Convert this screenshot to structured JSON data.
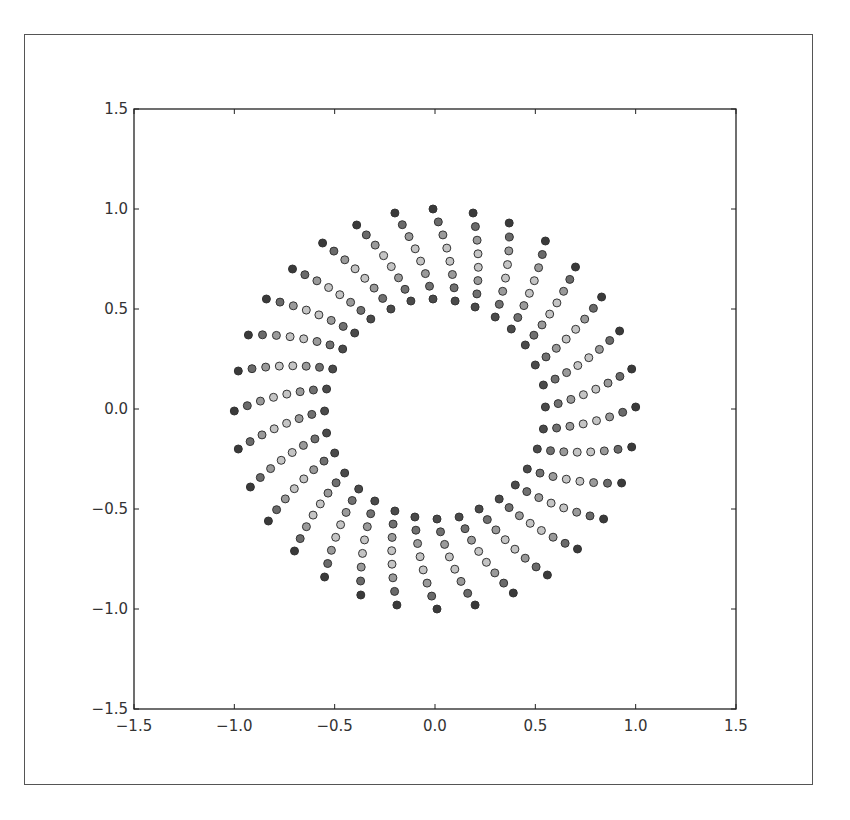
{
  "figure": {
    "frame_color": "#555555",
    "background": "#ffffff"
  },
  "chart_data": {
    "type": "scatter",
    "title": "",
    "xlabel": "",
    "ylabel": "",
    "xlim": [
      -1.5,
      1.5
    ],
    "ylim": [
      -1.5,
      1.5
    ],
    "xticks": [
      "−1.5",
      "−1.0",
      "−0.5",
      "0.0",
      "0.5",
      "1.0",
      "1.5"
    ],
    "yticks": [
      "−1.5",
      "−1.0",
      "−0.5",
      "0.0",
      "0.5",
      "1.0",
      "1.5"
    ],
    "xtick_values": [
      -1.5,
      -1.0,
      -0.5,
      0.0,
      0.5,
      1.0,
      1.5
    ],
    "ytick_values": [
      -1.5,
      -1.0,
      -0.5,
      0.0,
      0.5,
      1.0,
      1.5
    ],
    "grid": false,
    "legend": null,
    "points_per_spoke": 8,
    "marker_size": 8,
    "marker_edge_color": "#333333",
    "point_colors": [
      "#4a4a4a",
      "#707070",
      "#9a9a9a",
      "#c4c4c4",
      "#c4c4c4",
      "#9a9a9a",
      "#6a6a6a",
      "#3a3a3a"
    ],
    "spokes": [
      {
        "inner": [
          0.54,
          -0.1
        ],
        "outer": [
          1.0,
          0.01
        ]
      },
      {
        "inner": [
          0.55,
          0.01
        ],
        "outer": [
          0.98,
          0.2
        ]
      },
      {
        "inner": [
          0.54,
          0.12
        ],
        "outer": [
          0.92,
          0.39
        ]
      },
      {
        "inner": [
          0.5,
          0.22
        ],
        "outer": [
          0.83,
          0.56
        ]
      },
      {
        "inner": [
          0.45,
          0.32
        ],
        "outer": [
          0.7,
          0.71
        ]
      },
      {
        "inner": [
          0.38,
          0.4
        ],
        "outer": [
          0.55,
          0.84
        ]
      },
      {
        "inner": [
          0.3,
          0.46
        ],
        "outer": [
          0.37,
          0.93
        ]
      },
      {
        "inner": [
          0.2,
          0.51
        ],
        "outer": [
          0.19,
          0.98
        ]
      },
      {
        "inner": [
          0.1,
          0.54
        ],
        "outer": [
          -0.01,
          1.0
        ]
      },
      {
        "inner": [
          -0.01,
          0.55
        ],
        "outer": [
          -0.2,
          0.98
        ]
      },
      {
        "inner": [
          -0.12,
          0.54
        ],
        "outer": [
          -0.39,
          0.92
        ]
      },
      {
        "inner": [
          -0.22,
          0.5
        ],
        "outer": [
          -0.56,
          0.83
        ]
      },
      {
        "inner": [
          -0.32,
          0.45
        ],
        "outer": [
          -0.71,
          0.7
        ]
      },
      {
        "inner": [
          -0.4,
          0.38
        ],
        "outer": [
          -0.84,
          0.55
        ]
      },
      {
        "inner": [
          -0.46,
          0.3
        ],
        "outer": [
          -0.93,
          0.37
        ]
      },
      {
        "inner": [
          -0.51,
          0.2
        ],
        "outer": [
          -0.98,
          0.19
        ]
      },
      {
        "inner": [
          -0.54,
          0.1
        ],
        "outer": [
          -1.0,
          -0.01
        ]
      },
      {
        "inner": [
          -0.55,
          -0.01
        ],
        "outer": [
          -0.98,
          -0.2
        ]
      },
      {
        "inner": [
          -0.54,
          -0.12
        ],
        "outer": [
          -0.92,
          -0.39
        ]
      },
      {
        "inner": [
          -0.5,
          -0.22
        ],
        "outer": [
          -0.83,
          -0.56
        ]
      },
      {
        "inner": [
          -0.45,
          -0.32
        ],
        "outer": [
          -0.7,
          -0.71
        ]
      },
      {
        "inner": [
          -0.38,
          -0.4
        ],
        "outer": [
          -0.55,
          -0.84
        ]
      },
      {
        "inner": [
          -0.3,
          -0.46
        ],
        "outer": [
          -0.37,
          -0.93
        ]
      },
      {
        "inner": [
          -0.2,
          -0.51
        ],
        "outer": [
          -0.19,
          -0.98
        ]
      },
      {
        "inner": [
          -0.1,
          -0.54
        ],
        "outer": [
          0.01,
          -1.0
        ]
      },
      {
        "inner": [
          0.01,
          -0.55
        ],
        "outer": [
          0.2,
          -0.98
        ]
      },
      {
        "inner": [
          0.12,
          -0.54
        ],
        "outer": [
          0.39,
          -0.92
        ]
      },
      {
        "inner": [
          0.22,
          -0.5
        ],
        "outer": [
          0.56,
          -0.83
        ]
      },
      {
        "inner": [
          0.32,
          -0.45
        ],
        "outer": [
          0.71,
          -0.7
        ]
      },
      {
        "inner": [
          0.4,
          -0.38
        ],
        "outer": [
          0.84,
          -0.55
        ]
      },
      {
        "inner": [
          0.46,
          -0.3
        ],
        "outer": [
          0.93,
          -0.37
        ]
      },
      {
        "inner": [
          0.51,
          -0.2
        ],
        "outer": [
          0.98,
          -0.19
        ]
      }
    ]
  }
}
